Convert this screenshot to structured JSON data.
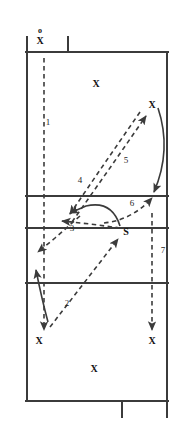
{
  "diagram": {
    "type": "volleyball-court-play",
    "colors": {
      "line": "#3b3b3b",
      "path": "#3b3b3b",
      "text": "#111111",
      "background": "#ffffff"
    },
    "court": {
      "left": 26,
      "right": 168,
      "top": 52,
      "bottom": 401,
      "horizontal_lines": [
        52,
        196,
        238,
        283,
        401
      ],
      "top_tick_x": 68,
      "bottom_tick_x": 122
    },
    "players": [
      {
        "id": "server",
        "label": "X",
        "x": 40,
        "y": 41,
        "ball": "o"
      },
      {
        "id": "back-left",
        "label": "X",
        "x": 96,
        "y": 84
      },
      {
        "id": "front-right",
        "label": "X",
        "x": 152,
        "y": 105
      },
      {
        "id": "receiver-left",
        "label": "X",
        "x": 39,
        "y": 341
      },
      {
        "id": "receiver-right",
        "label": "X",
        "x": 152,
        "y": 341
      },
      {
        "id": "receiver-mid",
        "label": "X",
        "x": 94,
        "y": 369
      }
    ],
    "setter": {
      "id": "setter",
      "label": "S",
      "x": 126,
      "y": 232
    },
    "ball_marker": {
      "label": "o",
      "x": 40,
      "y": 31
    },
    "steps": [
      {
        "number": "1",
        "x": 48,
        "y": 122,
        "description": "Serve travels down the line"
      },
      {
        "number": "2",
        "x": 67,
        "y": 303,
        "description": "Pass from left back to setter"
      },
      {
        "number": "3",
        "x": 72,
        "y": 228,
        "description": "Set delivered to outside"
      },
      {
        "number": "4",
        "x": 80,
        "y": 180,
        "description": "Attack approach cross court"
      },
      {
        "number": "5",
        "x": 126,
        "y": 160,
        "description": "Attack hit to deep corner"
      },
      {
        "number": "6",
        "x": 132,
        "y": 203,
        "description": "Cover movement to right side"
      },
      {
        "number": "7",
        "x": 163,
        "y": 250,
        "description": "Right side transition deep"
      }
    ]
  }
}
